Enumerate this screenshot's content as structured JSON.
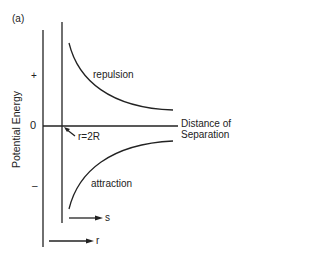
{
  "figure": {
    "panel_label": "(a)",
    "y_axis_label": "Potential Energy",
    "x_axis_label_line1": "Distance of",
    "x_axis_label_line2": "Separation",
    "tick_plus": "+",
    "tick_zero": "0",
    "tick_minus": "–",
    "curve_upper_label": "repulsion",
    "curve_lower_label": "attraction",
    "marker_label": "r=2R",
    "arrow_s_label": "s",
    "arrow_r_label": "r",
    "line_color": "#222222"
  }
}
